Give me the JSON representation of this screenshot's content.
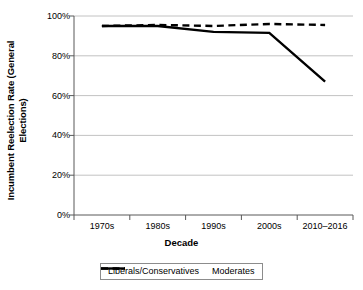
{
  "chart_data": {
    "type": "line",
    "title": "",
    "subtitle": "",
    "xlabel": "Decade",
    "ylabel": "Incumbent Reelection Rate (General Elections)",
    "categories": [
      "1970s",
      "1980s",
      "1990s",
      "2000s",
      "2010–2016"
    ],
    "ytick_labels": [
      "0%",
      "20%",
      "40%",
      "60%",
      "80%",
      "100%"
    ],
    "ytick_values": [
      0,
      20,
      40,
      60,
      80,
      100
    ],
    "ylim": [
      0,
      100
    ],
    "grid": "horizontal",
    "legend_position": "bottom",
    "series": [
      {
        "name": "Liberals/Conservatives",
        "style": "dashed",
        "color": "#000000",
        "values": [
          95,
          95.5,
          95,
          96,
          95.5
        ]
      },
      {
        "name": "Moderates",
        "style": "solid",
        "color": "#000000",
        "values": [
          95,
          95,
          92,
          91.5,
          67
        ]
      }
    ]
  },
  "ylabel_line1": "Incumbent Reelection Rate (General",
  "ylabel_line2": "Elections)",
  "axis": {
    "y_tick_0": "0%",
    "y_tick_1": "20%",
    "y_tick_2": "40%",
    "y_tick_3": "60%",
    "y_tick_4": "80%",
    "y_tick_5": "100%",
    "x_tick_0": "1970s",
    "x_tick_1": "1980s",
    "x_tick_2": "1990s",
    "x_tick_3": "2000s",
    "x_tick_4": "2010–2016",
    "x_title": "Decade"
  },
  "legend": {
    "item_0": "Liberals/Conservatives",
    "item_1": "Moderates"
  },
  "colors": {
    "line": "#000000",
    "grid": "#b3b3b3",
    "axis": "#595959",
    "legend_border": "#8c8c8c",
    "background": "#ffffff"
  }
}
